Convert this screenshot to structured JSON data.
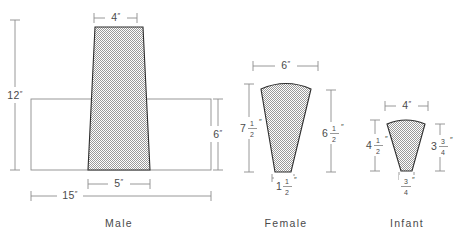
{
  "figure": {
    "title_present": false,
    "fill_pattern": "gray-stipple-hatch",
    "line_color": "#2e2e2e",
    "dim_color": "#8d8d8d",
    "fill_color": "#b0b0b0",
    "unit_symbol": "″"
  },
  "panels": [
    {
      "id": "male",
      "caption": "Male",
      "shape": "trapezoid-over-rectangle",
      "dimensions": [
        {
          "name": "top-width",
          "whole": "4",
          "num": "",
          "den": "",
          "unit": "″",
          "orientation": "horizontal",
          "position": "top"
        },
        {
          "name": "total-height",
          "whole": "12",
          "num": "",
          "den": "",
          "unit": "″",
          "orientation": "vertical",
          "position": "left"
        },
        {
          "name": "rect-height",
          "whole": "6",
          "num": "",
          "den": "",
          "unit": "″",
          "orientation": "vertical",
          "position": "right"
        },
        {
          "name": "base-width",
          "whole": "5",
          "num": "",
          "den": "",
          "unit": "″",
          "orientation": "horizontal",
          "position": "bottom-inner"
        },
        {
          "name": "rect-width",
          "whole": "15",
          "num": "",
          "den": "",
          "unit": "″",
          "orientation": "horizontal",
          "position": "bottom-outer"
        }
      ]
    },
    {
      "id": "female",
      "caption": "Female",
      "shape": "fan-wedge",
      "dimensions": [
        {
          "name": "top-width",
          "whole": "6",
          "num": "",
          "den": "",
          "unit": "″",
          "orientation": "horizontal",
          "position": "top"
        },
        {
          "name": "left-height",
          "whole": "7",
          "num": "1",
          "den": "2",
          "unit": "″",
          "orientation": "vertical",
          "position": "left"
        },
        {
          "name": "right-height",
          "whole": "6",
          "num": "1",
          "den": "2",
          "unit": "″",
          "orientation": "vertical",
          "position": "right"
        },
        {
          "name": "base-width",
          "whole": "1",
          "num": "1",
          "den": "2",
          "unit": "″",
          "orientation": "horizontal",
          "position": "bottom"
        }
      ]
    },
    {
      "id": "infant",
      "caption": "Infant",
      "shape": "fan-wedge",
      "dimensions": [
        {
          "name": "top-width",
          "whole": "4",
          "num": "",
          "den": "",
          "unit": "″",
          "orientation": "horizontal",
          "position": "top"
        },
        {
          "name": "left-height",
          "whole": "4",
          "num": "1",
          "den": "2",
          "unit": "″",
          "orientation": "vertical",
          "position": "left"
        },
        {
          "name": "right-height",
          "whole": "3",
          "num": "3",
          "den": "4",
          "unit": "″",
          "orientation": "vertical",
          "position": "right"
        },
        {
          "name": "base-width",
          "whole": "",
          "num": "3",
          "den": "4",
          "unit": "″",
          "orientation": "horizontal",
          "position": "bottom"
        }
      ]
    }
  ],
  "labels": {
    "male_4": "4",
    "male_12": "12",
    "male_6": "6",
    "male_5": "5",
    "male_15": "15",
    "female_6": "6",
    "female_7_whole": "7",
    "female_7_num": "1",
    "female_7_den": "2",
    "female_65_whole": "6",
    "female_65_num": "1",
    "female_65_den": "2",
    "female_15_whole": "1",
    "female_15_num": "1",
    "female_15_den": "2",
    "infant_4": "4",
    "infant_45_whole": "4",
    "infant_45_num": "1",
    "infant_45_den": "2",
    "infant_375_whole": "3",
    "infant_375_num": "3",
    "infant_375_den": "4",
    "infant_34_num": "3",
    "infant_34_den": "4",
    "caption_male": "Male",
    "caption_female": "Female",
    "caption_infant": "Infant",
    "prime": "″"
  }
}
